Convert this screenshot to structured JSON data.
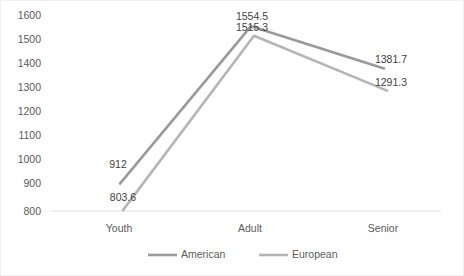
{
  "chart_data": {
    "type": "line",
    "title": "",
    "xlabel": "",
    "ylabel": "",
    "categories": [
      "Youth",
      "Adult",
      "Senior"
    ],
    "ylim": [
      800,
      1600
    ],
    "yticks": [
      "800",
      "900",
      "1000",
      "1100",
      "1200",
      "1300",
      "1400",
      "1500",
      "1600"
    ],
    "grid": false,
    "legend_position": "bottom",
    "series": [
      {
        "name": "American",
        "color": "#9a9a9a",
        "values": [
          912,
          1554.5,
          1381.7
        ],
        "labels": [
          "912",
          "1554.5",
          "1381.7"
        ]
      },
      {
        "name": "European",
        "color": "#b5b5b5",
        "values": [
          803.6,
          1515.3,
          1291.3
        ],
        "labels": [
          "803.6",
          "1515.3",
          "1291.3"
        ]
      }
    ]
  },
  "axis": {
    "baseline_color": "#e0e0e0"
  }
}
